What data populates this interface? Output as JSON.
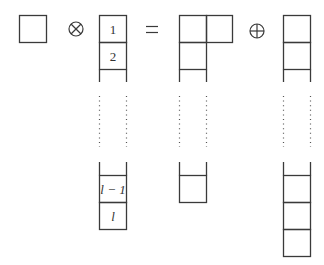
{
  "diagram": {
    "operators": {
      "tensor": "⊗",
      "equals": "=",
      "direct_sum": "⊕"
    },
    "left_factor": {
      "label": "single-box"
    },
    "column": {
      "labels": [
        "1",
        "2",
        "l − 1",
        "l"
      ]
    },
    "result_1": {
      "label": "hook-shape (2,1,...,1)"
    },
    "result_2": {
      "label": "column of length l+1"
    }
  }
}
